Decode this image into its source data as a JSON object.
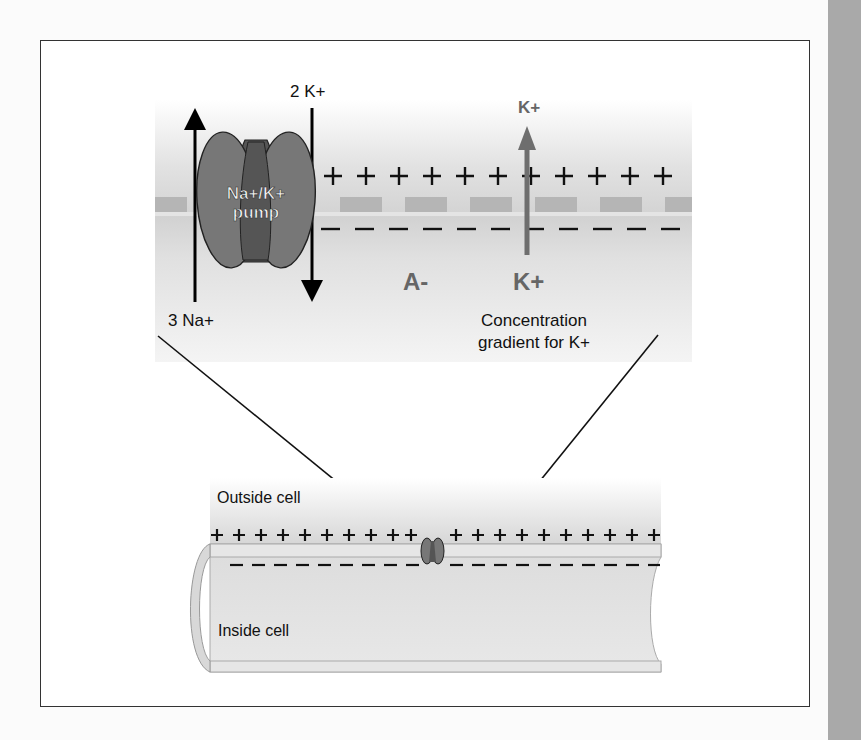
{
  "figure": {
    "upper_panel": {
      "pump_label_line1": "Na+/K+",
      "pump_label_line2": "pump",
      "efflux_label": "3 Na+",
      "influx_label": "2 K+",
      "k_top_label": "K+",
      "k_bottom_label": "K+",
      "anion_label": "A-",
      "gradient_label_line1": "Concentration",
      "gradient_label_line2": "gradient for K+",
      "outside_charge": "+",
      "inside_charge": "−",
      "plus_count": 9,
      "minus_count": 9
    },
    "lower_panel": {
      "outside_label": "Outside cell",
      "inside_label": "Inside cell",
      "outside_charge": "+",
      "inside_charge": "−"
    },
    "colors": {
      "pump_fill": "#777777",
      "pump_core": "#555555",
      "k_arrow": "#6e6e6e",
      "membrane_block": "#b3b3b3",
      "panel_gray": "#d4d4d4",
      "side_strip": "#a9a9a9",
      "frame": "#333333"
    }
  }
}
